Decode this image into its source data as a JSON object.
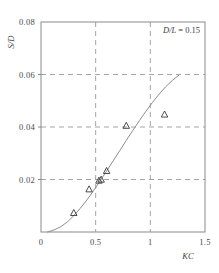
{
  "chart_data": {
    "type": "scatter",
    "title": "",
    "subtitle": "",
    "xlabel": "KC",
    "ylabel": "S/D",
    "xlim": [
      0,
      1.5
    ],
    "ylim": [
      0,
      0.08
    ],
    "grid": true,
    "grid_style": "dashed",
    "xticks": [
      0,
      0.5,
      1,
      1.5
    ],
    "xtick_labels": [
      "0",
      "0.5",
      "1",
      "1.5"
    ],
    "yticks": [
      0,
      0.02,
      0.04,
      0.06,
      0.08
    ],
    "ytick_labels": [
      "",
      "0.02",
      "0.04",
      "0.06",
      "0.08"
    ],
    "annotations": [
      {
        "name": "parameter-label",
        "text": "D/L = 0.15",
        "symbol": "D/L",
        "operator": "=",
        "value": "0.15",
        "x": 1.18,
        "y": 0.0735
      }
    ],
    "legend": {
      "visible": false,
      "position": "none"
    },
    "series": [
      {
        "name": "measured",
        "type": "scatter",
        "marker": "triangle-up-open",
        "color": "#3a3a3a",
        "points": [
          {
            "x": 0.3,
            "y": 0.0073
          },
          {
            "x": 0.44,
            "y": 0.0163
          },
          {
            "x": 0.53,
            "y": 0.0196
          },
          {
            "x": 0.55,
            "y": 0.02
          },
          {
            "x": 0.6,
            "y": 0.0233
          },
          {
            "x": 0.78,
            "y": 0.0405
          },
          {
            "x": 1.13,
            "y": 0.0448
          }
        ]
      },
      {
        "name": "fitted-curve",
        "type": "line",
        "color": "#8d8d8d",
        "points": [
          {
            "x": 0.06,
            "y": 0.0
          },
          {
            "x": 0.12,
            "y": 0.0008
          },
          {
            "x": 0.18,
            "y": 0.002
          },
          {
            "x": 0.24,
            "y": 0.0038
          },
          {
            "x": 0.3,
            "y": 0.0062
          },
          {
            "x": 0.36,
            "y": 0.0091
          },
          {
            "x": 0.42,
            "y": 0.0122
          },
          {
            "x": 0.48,
            "y": 0.0157
          },
          {
            "x": 0.54,
            "y": 0.0194
          },
          {
            "x": 0.6,
            "y": 0.0232
          },
          {
            "x": 0.66,
            "y": 0.0271
          },
          {
            "x": 0.72,
            "y": 0.031
          },
          {
            "x": 0.78,
            "y": 0.0349
          },
          {
            "x": 0.84,
            "y": 0.0387
          },
          {
            "x": 0.9,
            "y": 0.0424
          },
          {
            "x": 0.96,
            "y": 0.046
          },
          {
            "x": 1.02,
            "y": 0.0494
          },
          {
            "x": 1.08,
            "y": 0.0525
          },
          {
            "x": 1.14,
            "y": 0.0553
          },
          {
            "x": 1.2,
            "y": 0.0577
          },
          {
            "x": 1.26,
            "y": 0.0597
          }
        ]
      }
    ],
    "colors": {
      "axis": "#8a8a8a",
      "grid": "#9a9a9a",
      "curve": "#8d8d8d",
      "marker": "#3a3a3a",
      "text": "#3d3d3d",
      "background": "#ffffff"
    }
  }
}
